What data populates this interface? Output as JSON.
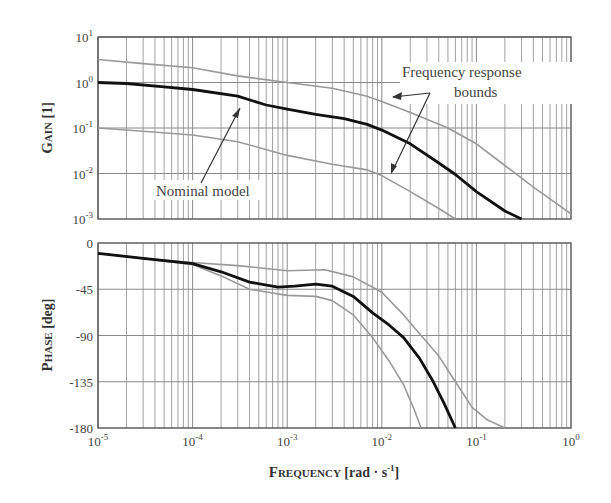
{
  "chart_data": [
    {
      "type": "line",
      "title": "",
      "xlabel": "FREQUENCY [rad · s-1]",
      "ylabel": "GAIN [1]",
      "xscale": "log",
      "yscale": "log",
      "xlim": [
        1e-05,
        1
      ],
      "ylim": [
        0.001,
        10
      ],
      "grid": true,
      "x_tick_labels": [
        "10-5",
        "10-4",
        "10-3",
        "10-2",
        "10-1",
        "100"
      ],
      "y_tick_labels": [
        "101",
        "100",
        "10-1",
        "10-2",
        "10-3"
      ],
      "annotations": [
        "Nominal model",
        "Frequency response",
        "bounds"
      ],
      "series": [
        {
          "name": "Nominal model",
          "color": "#111111",
          "x": [
            1e-05,
            2e-05,
            5e-05,
            0.0001,
            0.0003,
            0.0006,
            0.001,
            0.002,
            0.004,
            0.007,
            0.01,
            0.02,
            0.04,
            0.06,
            0.1,
            0.2,
            0.3
          ],
          "values": [
            1.0,
            0.95,
            0.8,
            0.7,
            0.5,
            0.32,
            0.26,
            0.2,
            0.16,
            0.12,
            0.09,
            0.045,
            0.017,
            0.0095,
            0.004,
            0.0015,
            0.001
          ]
        },
        {
          "name": "Upper bound",
          "color": "#999999",
          "x": [
            1e-05,
            3e-05,
            0.0001,
            0.0003,
            0.001,
            0.003,
            0.007,
            0.01,
            0.02,
            0.05,
            0.1,
            0.2,
            0.4,
            1
          ],
          "values": [
            3.2,
            2.6,
            2.1,
            1.4,
            1.0,
            0.75,
            0.5,
            0.38,
            0.22,
            0.1,
            0.045,
            0.015,
            0.005,
            0.0013
          ]
        },
        {
          "name": "Lower bound",
          "color": "#999999",
          "x": [
            1e-05,
            3e-05,
            0.0001,
            0.0003,
            0.001,
            0.003,
            0.007,
            0.01,
            0.02,
            0.04,
            0.06
          ],
          "values": [
            0.1,
            0.085,
            0.07,
            0.05,
            0.025,
            0.016,
            0.012,
            0.009,
            0.004,
            0.0017,
            0.001
          ]
        }
      ]
    },
    {
      "type": "line",
      "title": "",
      "xlabel": "FREQUENCY [rad · s-1]",
      "ylabel": "PHASE [deg]",
      "xscale": "log",
      "xlim": [
        1e-05,
        1
      ],
      "ylim": [
        -180,
        0
      ],
      "grid": true,
      "x_tick_labels": [
        "10-5",
        "10-4",
        "10-3",
        "10-2",
        "10-1",
        "100"
      ],
      "y_tick_labels": [
        "0",
        "-45",
        "-90",
        "-135",
        "-180"
      ],
      "series": [
        {
          "name": "Nominal model",
          "color": "#111111",
          "x": [
            1e-05,
            3e-05,
            0.0001,
            0.0002,
            0.0004,
            0.0008,
            0.0012,
            0.002,
            0.003,
            0.005,
            0.008,
            0.012,
            0.017,
            0.025,
            0.035,
            0.045,
            0.06
          ],
          "values": [
            -10,
            -15,
            -20,
            -28,
            -38,
            -43,
            -42,
            -40,
            -42,
            -52,
            -68,
            -80,
            -92,
            -112,
            -135,
            -155,
            -180
          ]
        },
        {
          "name": "Upper bound",
          "color": "#999999",
          "x": [
            1e-05,
            3e-05,
            0.0001,
            0.0003,
            0.001,
            0.0025,
            0.005,
            0.01,
            0.017,
            0.025,
            0.04,
            0.06,
            0.09,
            0.13,
            0.2
          ],
          "values": [
            -10,
            -15,
            -19,
            -22,
            -27,
            -26,
            -33,
            -48,
            -70,
            -88,
            -110,
            -135,
            -160,
            -172,
            -180
          ]
        },
        {
          "name": "Lower bound",
          "color": "#999999",
          "x": [
            1e-05,
            3e-05,
            0.0001,
            0.0002,
            0.0004,
            0.001,
            0.002,
            0.003,
            0.005,
            0.008,
            0.012,
            0.017,
            0.022,
            0.026
          ],
          "values": [
            -10,
            -15,
            -21,
            -32,
            -45,
            -51,
            -52,
            -56,
            -70,
            -92,
            -115,
            -138,
            -162,
            -180
          ]
        }
      ]
    }
  ],
  "labels": {
    "gain_ylabel_cap": "G",
    "gain_ylabel_small": "AIN",
    "gain_ylabel_unit": " [1]",
    "phase_ylabel_cap": "P",
    "phase_ylabel_small": "HASE",
    "phase_ylabel_unit": " [deg]",
    "xlabel_cap": "F",
    "xlabel_small": "REQUENCY",
    "xlabel_unit": " [rad · s",
    "xlabel_exp": "-1",
    "xlabel_close": "]",
    "annot_nominal": "Nominal model",
    "annot_bounds_1": "Frequency response",
    "annot_bounds_2": "bounds"
  }
}
